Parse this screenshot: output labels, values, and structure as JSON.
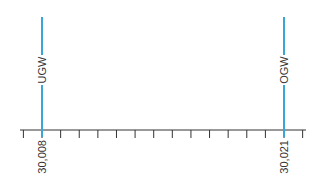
{
  "diagram": {
    "type": "tolerance-scale",
    "axis": {
      "min": 30.007,
      "max": 30.022,
      "tick_step": 0.001,
      "tick_count": 16,
      "color": "#333333"
    },
    "markers": [
      {
        "name": "UGW",
        "value": 30.008,
        "value_label": "30,008",
        "color": "#3aa6d8"
      },
      {
        "name": "OGW",
        "value": 30.021,
        "value_label": "30,021",
        "color": "#3aa6d8"
      }
    ]
  }
}
